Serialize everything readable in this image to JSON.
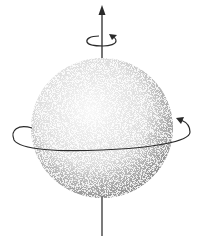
{
  "figure": {
    "colors": {
      "background": "#ffffff",
      "stroke": "#2a2a2a",
      "stipple": "#555555"
    },
    "sphere": {
      "cx": 102,
      "cy": 128,
      "rx": 71,
      "ry": 70
    },
    "axis": {
      "x": 102,
      "y_top": 6,
      "y_bottom": 236
    },
    "top_rotation_ring": {
      "cx": 101,
      "cy": 40,
      "rx": 14,
      "ry": 5
    },
    "equator_ring": {
      "cx": 102,
      "cy": 134,
      "rx": 90,
      "ry": 16
    }
  }
}
